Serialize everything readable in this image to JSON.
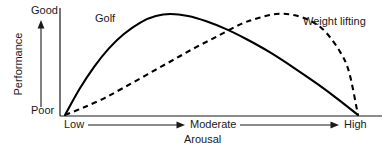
{
  "chart_data": {
    "type": "line",
    "title": "",
    "subtitle": "",
    "xlabel": "Arousal",
    "ylabel": "Performance",
    "x_tick_labels": [
      "Low",
      "Moderate",
      "High"
    ],
    "y_tick_labels": [
      "Poor",
      "Good"
    ],
    "xlim": [
      0,
      1
    ],
    "ylim": [
      0,
      1
    ],
    "grid": false,
    "legend_position": "inline-annotation",
    "annotations": [
      "Golf",
      "Weight lifting"
    ],
    "series": [
      {
        "name": "Golf",
        "style": "solid",
        "color": "#000000",
        "peak_x": 0.36,
        "x": [
          0.0,
          0.05,
          0.1,
          0.15,
          0.2,
          0.26,
          0.31,
          0.36,
          0.42,
          0.48,
          0.55,
          0.62,
          0.7,
          0.78,
          0.86,
          0.93,
          1.0
        ],
        "y": [
          0.0,
          0.26,
          0.48,
          0.66,
          0.8,
          0.92,
          0.98,
          1.0,
          0.98,
          0.93,
          0.85,
          0.75,
          0.62,
          0.47,
          0.31,
          0.16,
          0.0
        ]
      },
      {
        "name": "Weight lifting",
        "style": "dashed",
        "color": "#000000",
        "peak_x": 0.72,
        "x": [
          0.0,
          0.06,
          0.13,
          0.2,
          0.28,
          0.36,
          0.44,
          0.52,
          0.6,
          0.66,
          0.72,
          0.78,
          0.84,
          0.89,
          0.94,
          0.97,
          1.0
        ],
        "y": [
          0.0,
          0.07,
          0.16,
          0.27,
          0.4,
          0.53,
          0.66,
          0.78,
          0.9,
          0.96,
          1.0,
          0.99,
          0.93,
          0.82,
          0.62,
          0.42,
          0.0
        ]
      }
    ],
    "axis_arrows": {
      "y_axis_arrow": "up",
      "x_axis_arrow_low_to_moderate": "right",
      "x_axis_arrow_moderate_to_high": "right"
    },
    "colors": {
      "background": "#ffffff",
      "axis": "#1a1a1a",
      "curve": "#000000"
    }
  },
  "labels": {
    "y_top": "Good",
    "y_bottom": "Poor",
    "y_title": "Performance",
    "x_left": "Low",
    "x_middle": "Moderate",
    "x_right": "High",
    "x_title": "Arousal",
    "series_golf": "Golf",
    "series_weight": "Weight lifting"
  }
}
